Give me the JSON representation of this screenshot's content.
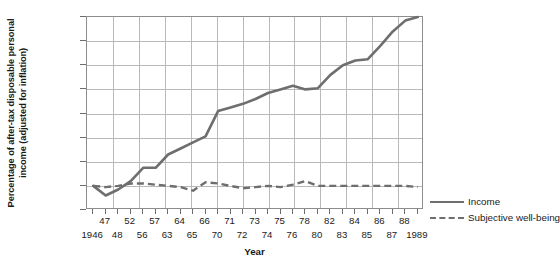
{
  "chart_data": {
    "type": "line",
    "title": "",
    "xlabel": "Year",
    "ylabel": "Percentage of after-tax disposable personal income (adjusted for inflation)",
    "ylabel_line1": "Percentage of after-tax disposable personal",
    "ylabel_line2": "income (adjusted for inflation)",
    "ylim": [
      80,
      240
    ],
    "yticks": [
      80,
      100,
      120,
      140,
      160,
      180,
      200,
      220,
      240
    ],
    "grid": true,
    "legend_position": "right",
    "x_tick_labels": [
      "1946",
      "47",
      "48",
      "52",
      "56",
      "57",
      "63",
      "64",
      "65",
      "66",
      "70",
      "71",
      "72",
      "73",
      "74",
      "75",
      "76",
      "78",
      "80",
      "82",
      "83",
      "84",
      "85",
      "86",
      "87",
      "88",
      "1989"
    ],
    "x_tick_rows": [
      1,
      0,
      1,
      0,
      1,
      0,
      1,
      0,
      1,
      0,
      1,
      0,
      1,
      0,
      1,
      0,
      1,
      0,
      1,
      0,
      1,
      0,
      1,
      0,
      1,
      0,
      1
    ],
    "categories": [
      "1946",
      "47",
      "48",
      "52",
      "56",
      "57",
      "63",
      "64",
      "65",
      "66",
      "70",
      "71",
      "72",
      "73",
      "74",
      "75",
      "76",
      "78",
      "80",
      "82",
      "83",
      "84",
      "85",
      "86",
      "87",
      "88",
      "1989"
    ],
    "series": [
      {
        "name": "Income",
        "style": "solid",
        "color": "#6e6e6e",
        "values": [
          100,
          92,
          97,
          104,
          115,
          115,
          126,
          131,
          136,
          141,
          162,
          165,
          168,
          172,
          177,
          180,
          183,
          180,
          181,
          192,
          200,
          204,
          205,
          216,
          228,
          237,
          240
        ]
      },
      {
        "name": "Subjective well-being",
        "style": "dashed",
        "color": "#6e6e6e",
        "values": [
          100,
          99,
          100,
          102,
          102,
          101,
          100,
          99,
          96,
          103,
          102,
          100,
          98,
          99,
          100,
          99,
          101,
          104,
          100,
          100,
          100,
          100,
          100,
          100,
          100,
          100,
          99
        ]
      }
    ]
  },
  "legend": {
    "items": [
      {
        "label": "Income",
        "style": "solid"
      },
      {
        "label": "Subjective well-being",
        "style": "dashed"
      }
    ]
  },
  "axes": {
    "y_title_line1": "Percentage of after-tax disposable personal",
    "y_title_line2": "income (adjusted for inflation)",
    "x_title": "Year"
  },
  "colors": {
    "line": "#6e6e6e",
    "grid": "#b9b9b9",
    "frame": "#8d8d8d",
    "text": "#1a1a1a"
  }
}
